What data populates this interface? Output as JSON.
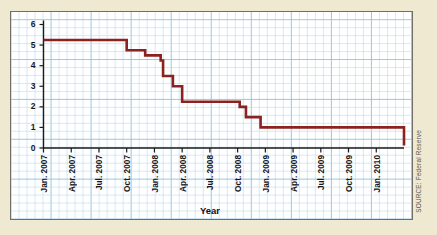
{
  "chart_data": {
    "type": "line",
    "title": "",
    "subtitle": "",
    "xlabel": "Year",
    "ylabel": "Percentage Points",
    "source": "SOURCE: Federal Reserve",
    "grid": true,
    "legend": "none",
    "line_color": "#8B2220",
    "grid_color": "#bcd9ef",
    "grid_major_color": "#8fc0e0",
    "panel_color": "#ffffff",
    "page_color": "#efe9d2",
    "ylim": [
      0,
      6.6
    ],
    "yticks": [
      0,
      1,
      2,
      3,
      4,
      5,
      6
    ],
    "ytick_labels": [
      "0",
      "1",
      "2",
      "3",
      "4",
      "5",
      "6"
    ],
    "xlim": [
      "2007-01",
      "2010-04"
    ],
    "xtick_labels": [
      "Jan. 2007",
      "Apr. 2007",
      "Jul. 2007",
      "Oct. 2007",
      "Jan. 2008",
      "Apr. 2008",
      "Jul. 2008",
      "Oct. 2008",
      "Jan. 2009",
      "Apr. 2009",
      "Jul. 2009",
      "Oct. 2009",
      "Jan. 2010"
    ],
    "series": [
      {
        "name": "Federal Funds Rate Target",
        "step": "post",
        "x": [
          "2007-01",
          "2007-09",
          "2007-10",
          "2007-12",
          "2008-01-22",
          "2008-01-30",
          "2008-03",
          "2008-04",
          "2008-10-08",
          "2008-10-29",
          "2008-12-16",
          "2010-04"
        ],
        "y": [
          5.25,
          5.25,
          4.75,
          4.5,
          4.25,
          3.5,
          3.0,
          2.25,
          2.0,
          1.5,
          1.0,
          0.125
        ],
        "values_note": "Target federal funds rate in percentage points, step changes"
      }
    ]
  }
}
